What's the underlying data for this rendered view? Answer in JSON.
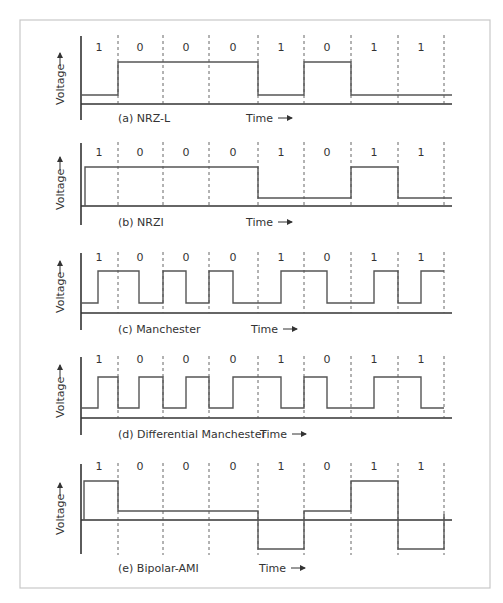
{
  "figure": {
    "bits": [
      "1",
      "0",
      "0",
      "0",
      "1",
      "0",
      "1",
      "1"
    ],
    "y_axis_label": "Voltage",
    "x_axis_label": "Time",
    "panels": [
      {
        "id": "a",
        "label": "(a)  NRZ-L"
      },
      {
        "id": "b",
        "label": "(b)  NRZI"
      },
      {
        "id": "c",
        "label": "(c)  Manchester"
      },
      {
        "id": "d",
        "label": "(d)  Differential Manchester"
      },
      {
        "id": "e",
        "label": "(e)  Bipolar-AMI"
      }
    ],
    "colors": {
      "signal": "#555555",
      "axis": "#333333",
      "frame": "#c8c8c8"
    }
  }
}
